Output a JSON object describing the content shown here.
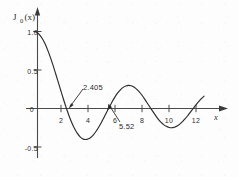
{
  "figure": {
    "background_color": "#fdfdfd",
    "ink_color": "#2b2b2b",
    "axis_color": "#4a4a4a"
  },
  "chart_data": {
    "type": "line",
    "title": "",
    "subtitle": "",
    "xlabel": "x",
    "ylabel": "J0(x)",
    "ylabel_base": "J",
    "ylabel_subscript": "0",
    "ylabel_arg": "(x)",
    "xlim": [
      0,
      13.2
    ],
    "ylim": [
      -0.72,
      1.12
    ],
    "grid": false,
    "legend": false,
    "legend_position": "none",
    "xticks": [
      2,
      4,
      6,
      8,
      10,
      12
    ],
    "xtick_labels": [
      "2",
      "4",
      "6",
      "8",
      "10",
      "12"
    ],
    "yticks": [
      1.0,
      0.5,
      0,
      -0.5
    ],
    "ytick_labels": [
      "1.0",
      "0.5",
      "0",
      "-0.5"
    ],
    "series": [
      {
        "name": "J0(x)",
        "x": [
          0.0,
          0.2,
          0.4,
          0.6,
          0.8,
          1.0,
          1.2,
          1.4,
          1.6,
          1.8,
          2.0,
          2.2,
          2.405,
          2.6,
          2.8,
          3.0,
          3.2,
          3.4,
          3.6,
          3.8,
          4.0,
          4.2,
          4.4,
          4.6,
          4.8,
          5.0,
          5.2,
          5.4,
          5.52,
          5.8,
          6.0,
          6.2,
          6.4,
          6.6,
          6.8,
          7.0,
          7.2,
          7.4,
          7.6,
          7.8,
          8.0,
          8.2,
          8.4,
          8.6,
          8.654,
          9.0,
          9.2,
          9.4,
          9.6,
          9.8,
          10.0,
          10.2,
          10.4,
          10.6,
          10.8,
          11.0,
          11.2,
          11.4,
          11.6,
          11.792,
          12.0,
          12.2,
          12.4,
          12.6
        ],
        "y": [
          1.0,
          0.99,
          0.96,
          0.912,
          0.846,
          0.765,
          0.671,
          0.567,
          0.455,
          0.34,
          0.224,
          0.11,
          0.0,
          -0.097,
          -0.185,
          -0.26,
          -0.32,
          -0.364,
          -0.392,
          -0.403,
          -0.397,
          -0.376,
          -0.342,
          -0.296,
          -0.24,
          -0.178,
          -0.111,
          -0.041,
          0.0,
          0.092,
          0.151,
          0.202,
          0.243,
          0.274,
          0.293,
          0.3,
          0.295,
          0.279,
          0.251,
          0.215,
          0.172,
          0.122,
          0.069,
          0.015,
          0.0,
          -0.09,
          -0.137,
          -0.177,
          -0.209,
          -0.232,
          -0.246,
          -0.25,
          -0.243,
          -0.228,
          -0.203,
          -0.171,
          -0.133,
          -0.09,
          -0.045,
          0.0,
          0.048,
          0.09,
          0.128,
          0.16
        ]
      }
    ],
    "annotations": [
      {
        "label": "2.405",
        "description": "first zero of J0",
        "x": 2.405,
        "y": 0.0
      },
      {
        "label": "5.52",
        "description": "second zero of J0",
        "x": 5.52,
        "y": 0.0
      }
    ]
  }
}
